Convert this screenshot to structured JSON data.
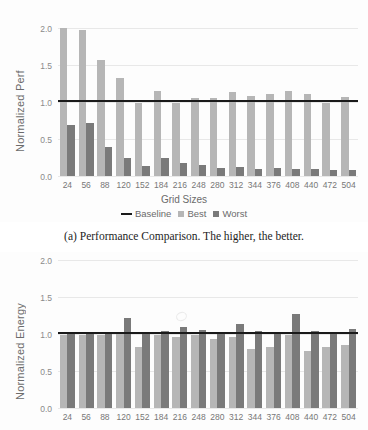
{
  "chart_data": [
    {
      "type": "bar",
      "title": "",
      "xlabel": "Grid Sizes",
      "ylabel": "Normalized Perf",
      "ylim": [
        0.0,
        2.0
      ],
      "yticks": [
        "0.0",
        "0.5",
        "1.0",
        "1.5",
        "2.0"
      ],
      "grid": true,
      "legend_position": "bottom",
      "categories": [
        "24",
        "56",
        "88",
        "120",
        "152",
        "184",
        "216",
        "248",
        "280",
        "312",
        "344",
        "376",
        "408",
        "440",
        "472",
        "504"
      ],
      "baseline": 1.0,
      "series": [
        {
          "name": "Best",
          "color": "#b6b6b6",
          "values": [
            2.0,
            1.97,
            1.57,
            1.32,
            0.99,
            1.15,
            0.99,
            1.06,
            1.05,
            1.14,
            1.08,
            1.11,
            1.15,
            1.11,
            0.99,
            1.07
          ]
        },
        {
          "name": "Worst",
          "color": "#7a7a7a",
          "values": [
            0.69,
            0.71,
            0.39,
            0.24,
            0.13,
            0.24,
            0.18,
            0.15,
            0.11,
            0.12,
            0.1,
            0.11,
            0.1,
            0.09,
            0.08,
            0.08
          ]
        }
      ],
      "legend": [
        {
          "label": "Baseline",
          "marker": "line",
          "color": "#1a1a1a"
        },
        {
          "label": "Best",
          "marker": "box",
          "color": "#b6b6b6"
        },
        {
          "label": "Worst",
          "marker": "box",
          "color": "#7a7a7a"
        }
      ],
      "caption": "(a) Performance Comparison. The higher, the better."
    },
    {
      "type": "bar",
      "title": "",
      "xlabel": "",
      "ylabel": "Normalized Energy",
      "ylim": [
        0.0,
        2.0
      ],
      "yticks": [
        "0.0",
        "0.5",
        "1.0",
        "1.5",
        "2.0"
      ],
      "grid": true,
      "legend_position": "none",
      "categories": [
        "24",
        "56",
        "88",
        "120",
        "152",
        "184",
        "216",
        "248",
        "280",
        "312",
        "344",
        "376",
        "408",
        "440",
        "472",
        "504"
      ],
      "baseline": 1.0,
      "series": [
        {
          "name": "Best",
          "color": "#b6b6b6",
          "values": [
            0.99,
            0.98,
            0.98,
            1.0,
            0.82,
            0.98,
            0.96,
            0.98,
            0.93,
            0.96,
            0.8,
            0.82,
            0.99,
            0.77,
            0.83,
            0.85
          ]
        },
        {
          "name": "Worst",
          "color": "#7a7a7a",
          "values": [
            1.02,
            1.01,
            1.01,
            1.22,
            1.01,
            1.04,
            1.1,
            1.05,
            1.03,
            1.14,
            1.04,
            1.03,
            1.27,
            1.04,
            1.0,
            1.07
          ]
        }
      ],
      "legend": [],
      "caption": ""
    }
  ]
}
